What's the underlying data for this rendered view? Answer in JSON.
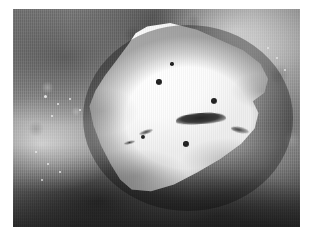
{
  "document": {
    "kind": "photograph",
    "subject": "gross-pathology-specimen",
    "description": "Grayscale close-up photograph of a sectioned gross pathology specimen. A pale, firm, wedge-shaped cut surface occupies the center, studded with several small dark punctate foci and crossed by a dark horizontal cleft. Surrounding it is darker mottled soft tissue with glistening specular highlights.",
    "color_mode": "grayscale",
    "border": {
      "background": "#ffffff",
      "left": 13,
      "top": 9,
      "width": 287,
      "height": 218
    }
  },
  "photo": {
    "background_tissue": {
      "label": "surrounding-soft-tissue",
      "tone_light": "#cfcfcf",
      "tone_mid": "#8d8d8d",
      "tone_dark": "#3c3c3c"
    },
    "specimen": {
      "label": "pale-cut-surface",
      "tone_light": "#ffffff",
      "tone_mid": "#f2f2f2",
      "tone_shadow": "#cccccc",
      "left": 78,
      "top": 23,
      "width": 192,
      "height": 170
    },
    "foci": [
      {
        "name": "focus-upper-left",
        "x": 159,
        "y": 82,
        "d": 5.5,
        "tone": "#1c1c1c"
      },
      {
        "name": "focus-upper-mid",
        "x": 172,
        "y": 64,
        "d": 3.4,
        "tone": "#2b2b2b"
      },
      {
        "name": "focus-upper-right",
        "x": 214,
        "y": 101,
        "d": 6.2,
        "tone": "#1a1a1a"
      },
      {
        "name": "focus-lower-left",
        "x": 143,
        "y": 137,
        "d": 4.6,
        "tone": "#232323"
      },
      {
        "name": "focus-lower-mid",
        "x": 186,
        "y": 144,
        "d": 5.4,
        "tone": "#1e1e1e"
      }
    ],
    "cleft": {
      "name": "horizontal-dark-cleft",
      "x": 176,
      "y": 113,
      "w": 50,
      "h": 11,
      "tone": "#262626"
    },
    "streaks": [
      {
        "name": "streak-left-upper",
        "x": 139,
        "y": 130,
        "w": 14,
        "h": 4,
        "rot": -18
      },
      {
        "name": "streak-left-lower",
        "x": 124,
        "y": 141,
        "w": 11,
        "h": 3,
        "rot": -14
      }
    ],
    "specular_highlights": [
      {
        "name": "highlight-left-1",
        "x": 45,
        "y": 96,
        "d": 3
      },
      {
        "name": "highlight-left-2",
        "x": 58,
        "y": 104,
        "d": 2.4
      },
      {
        "name": "highlight-left-3",
        "x": 70,
        "y": 99,
        "d": 2.2
      },
      {
        "name": "highlight-left-4",
        "x": 52,
        "y": 116,
        "d": 2.6
      },
      {
        "name": "highlight-left-5",
        "x": 80,
        "y": 110,
        "d": 2
      },
      {
        "name": "highlight-left-6",
        "x": 36,
        "y": 152,
        "d": 2.4
      },
      {
        "name": "highlight-left-7",
        "x": 48,
        "y": 164,
        "d": 2.8
      },
      {
        "name": "highlight-left-8",
        "x": 60,
        "y": 172,
        "d": 2.2
      },
      {
        "name": "highlight-left-9",
        "x": 42,
        "y": 180,
        "d": 2
      },
      {
        "name": "highlight-right-1",
        "x": 268,
        "y": 48,
        "d": 2.6
      },
      {
        "name": "highlight-right-2",
        "x": 277,
        "y": 58,
        "d": 2.2
      },
      {
        "name": "highlight-right-3",
        "x": 285,
        "y": 70,
        "d": 2
      },
      {
        "name": "highlight-top-1",
        "x": 141,
        "y": 34,
        "d": 2.2
      },
      {
        "name": "highlight-top-2",
        "x": 150,
        "y": 40,
        "d": 1.8
      }
    ]
  }
}
